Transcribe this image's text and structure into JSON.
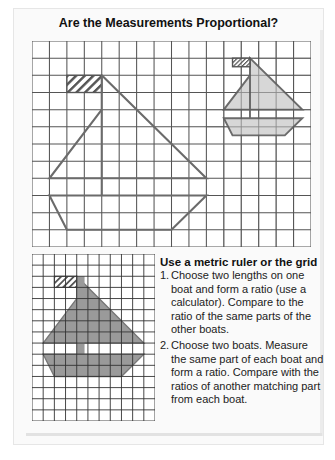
{
  "page": {
    "title": "Are the Measurements Proportional?"
  },
  "colors": {
    "grid_line": "#555555",
    "boat_outline": "#6b6b6b",
    "light_fill": "#d7d7d7",
    "dark_fill": "#9a9a9a",
    "background": "#ffffff"
  },
  "large_grid": {
    "columns": 16,
    "rows": 12,
    "boats": [
      {
        "name": "large-boat",
        "scale": 1,
        "fill": "none"
      },
      {
        "name": "half-size-boat",
        "scale": 0.5,
        "fill": "light"
      }
    ]
  },
  "small_grid": {
    "columns": 11,
    "rows": 15,
    "boats": [
      {
        "name": "shaded-boat",
        "scale": 1,
        "fill": "dark"
      }
    ]
  },
  "instructions": {
    "heading": "Use a metric ruler or the grid",
    "items": [
      {
        "number": "1.",
        "text": "Choose two lengths on one boat and form a ratio (use a calculator). Compare to the ratio of the same parts of the other boats."
      },
      {
        "number": "2.",
        "text": "Choose two boats. Measure the same part of each boat and form a ratio. Compare with the ratios of another matching part from each boat."
      }
    ]
  }
}
